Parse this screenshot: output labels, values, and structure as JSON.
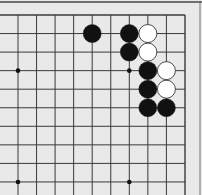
{
  "board": {
    "title": "Go problem diagram",
    "columns_visible": 10,
    "rows_visible": 10,
    "edges": [
      "top",
      "right"
    ],
    "colors": {
      "background": "#e9e9e9",
      "line": "#3a3a3a",
      "black_stone": "#111111",
      "white_stone": "#ffffff",
      "white_stone_outline": "#222222"
    },
    "star_points": [
      {
        "col": 0,
        "row": 3
      },
      {
        "col": 6,
        "row": 3
      },
      {
        "col": 0,
        "row": 9
      },
      {
        "col": 6,
        "row": 9
      }
    ],
    "stones": [
      {
        "color": "black",
        "col": 4,
        "row": 1
      },
      {
        "color": "black",
        "col": 6,
        "row": 1
      },
      {
        "color": "white",
        "col": 7,
        "row": 1
      },
      {
        "color": "black",
        "col": 6,
        "row": 2
      },
      {
        "color": "white",
        "col": 7,
        "row": 2
      },
      {
        "color": "black",
        "col": 7,
        "row": 3
      },
      {
        "color": "white",
        "col": 8,
        "row": 3
      },
      {
        "color": "black",
        "col": 7,
        "row": 4
      },
      {
        "color": "white",
        "col": 8,
        "row": 4
      },
      {
        "color": "black",
        "col": 7,
        "row": 5
      },
      {
        "color": "black",
        "col": 8,
        "row": 5
      }
    ]
  }
}
